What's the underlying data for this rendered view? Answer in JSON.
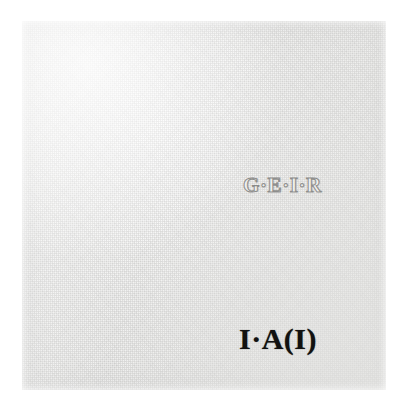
{
  "image": {
    "surface": "textured paper panel",
    "background_color": "#ffffff",
    "panel_color": "#f3f3f2"
  },
  "inscriptions": {
    "upper": {
      "text": "G·E·I·R",
      "style": "outlined serif capitals",
      "color": "#6c6c6a"
    },
    "lower": {
      "text": "I·A(I)",
      "style": "bold solid serif capitals",
      "color": "#111110"
    }
  }
}
